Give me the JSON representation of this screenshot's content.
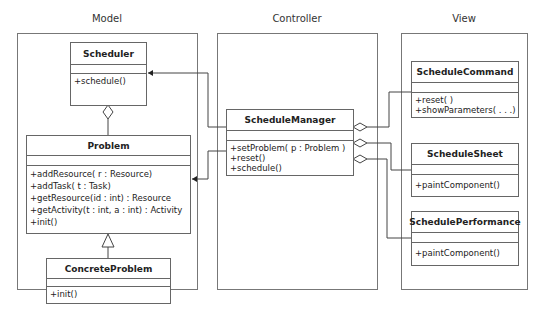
{
  "frames": {
    "model": {
      "title": "Model"
    },
    "controller": {
      "title": "Controller"
    },
    "view": {
      "title": "View"
    }
  },
  "classes": {
    "scheduler": {
      "name": "Scheduler",
      "methods": [
        "+schedule()"
      ]
    },
    "problem": {
      "name": "Problem",
      "methods": [
        "+addResource( r : Resource)",
        "+addTask( t : Task)",
        "+getResource(id : int) : Resource",
        "+getActivity(t : int, a : int) : Activity",
        "+init()"
      ]
    },
    "concrete_problem": {
      "name": "ConcreteProblem",
      "methods": [
        "+init()"
      ]
    },
    "schedule_manager": {
      "name": "ScheduleManager",
      "methods": [
        "+setProblem( p : Problem )",
        "+reset()",
        "+schedule()"
      ]
    },
    "schedule_command": {
      "name": "ScheduleCommand",
      "methods": [
        "+reset( )",
        "+showParameters( . . .)"
      ]
    },
    "schedule_sheet": {
      "name": "ScheduleSheet",
      "methods": [
        "+paintComponent()"
      ]
    },
    "schedule_performance": {
      "name": "SchedulePerformance",
      "methods": [
        "+paintComponent()"
      ]
    }
  },
  "relationships": [
    {
      "type": "aggregation",
      "from": "Scheduler",
      "to": "Problem"
    },
    {
      "type": "generalization",
      "from": "ConcreteProblem",
      "to": "Problem"
    },
    {
      "type": "association",
      "from": "ScheduleManager",
      "to": "Scheduler"
    },
    {
      "type": "association",
      "from": "ScheduleManager",
      "to": "Problem"
    },
    {
      "type": "aggregation",
      "from": "ScheduleManager",
      "to": "ScheduleCommand"
    },
    {
      "type": "aggregation",
      "from": "ScheduleManager",
      "to": "ScheduleSheet"
    },
    {
      "type": "aggregation",
      "from": "ScheduleManager",
      "to": "SchedulePerformance"
    }
  ]
}
